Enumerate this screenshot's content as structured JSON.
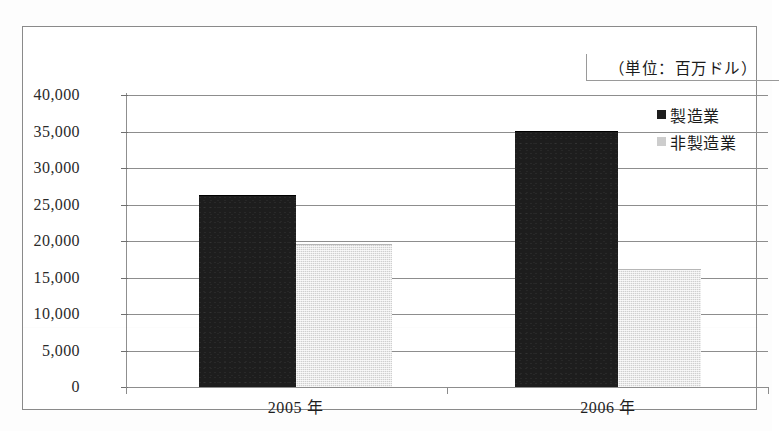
{
  "chart_data": {
    "type": "bar",
    "title": "（単位：百万ドル）",
    "xlabel": "",
    "ylabel": "",
    "categories": [
      "2005 年",
      "2006 年"
    ],
    "series": [
      {
        "name": "製造業",
        "values": [
          26300,
          35100
        ],
        "color": "#1d1d1d"
      },
      {
        "name": "非製造業",
        "values": [
          19600,
          16200
        ],
        "color": "#cfcfcf"
      }
    ],
    "ylim": [
      0,
      40000
    ],
    "ytick_values": [
      40000,
      35000,
      30000,
      25000,
      20000,
      15000,
      10000,
      5000,
      0
    ],
    "ytick_labels": [
      "40,000",
      "35,000",
      "30,000",
      "25,000",
      "20,000",
      "15,000",
      "10,000",
      "5,000",
      "0"
    ],
    "grid": true,
    "legend_position": "top-right"
  },
  "legend": {
    "items": [
      {
        "label": "製造業",
        "swatch": "legend-swatch-dark"
      },
      {
        "label": "非製造業",
        "swatch": "legend-swatch-light"
      }
    ]
  },
  "caption": {
    "unit": "（単位：百万ドル）"
  },
  "colors": {
    "manufacturing": "#1d1d1d",
    "nonmanufacturing": "#cfcfcf",
    "gridline": "#8d8d8d",
    "frame": "#8a8a8a",
    "text": "#1b1b1b"
  }
}
